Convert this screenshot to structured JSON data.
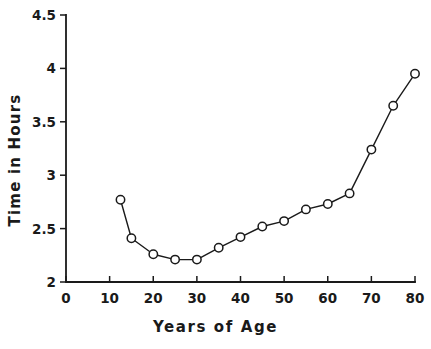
{
  "chart_data": {
    "type": "line",
    "title": "",
    "subtitle": "",
    "xlabel": "Years of Age",
    "ylabel": "Time in Hours",
    "xlim": [
      0,
      80
    ],
    "ylim": [
      2,
      4.5
    ],
    "grid": false,
    "legend": null,
    "xticks": [
      0,
      10,
      20,
      30,
      40,
      50,
      60,
      70,
      80
    ],
    "xtick_labels": [
      "0",
      "10",
      "20",
      "30",
      "40",
      "50",
      "60",
      "70",
      "80"
    ],
    "yticks": [
      2,
      2.5,
      3,
      3.5,
      4,
      4.5
    ],
    "ytick_labels": [
      "2",
      "2.5",
      "3",
      "3.5",
      "4",
      "4.5"
    ],
    "marker": "open-circle",
    "line_color": "#1a1a1a",
    "marker_face_color": "#ffffff",
    "series": [
      {
        "name": "Time in Hours",
        "x": [
          12.5,
          15,
          20,
          25,
          30,
          35,
          40,
          45,
          50,
          55,
          60,
          65,
          70,
          75,
          80
        ],
        "values": [
          2.77,
          2.41,
          2.26,
          2.21,
          2.21,
          2.32,
          2.42,
          2.52,
          2.57,
          2.68,
          2.73,
          2.83,
          3.24,
          3.65,
          3.95
        ]
      }
    ],
    "annotations": []
  },
  "axes": {
    "x_title": "Years of Age",
    "y_title": "Time in Hours"
  }
}
